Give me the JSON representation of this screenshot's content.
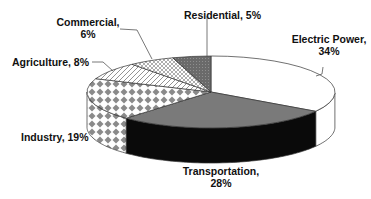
{
  "chart_data": {
    "type": "pie",
    "style": "3d",
    "title": "",
    "start_angle_deg": 90,
    "direction": "clockwise",
    "slices": [
      {
        "label": "Electric Power",
        "value": 34,
        "display": "Electric Power,",
        "pct_text": "34%",
        "fill": "white"
      },
      {
        "label": "Transportation",
        "value": 28,
        "display": "Transportation,",
        "pct_text": "28%",
        "fill": "black-side-gray-top"
      },
      {
        "label": "Industry",
        "value": 19,
        "display": "Industry, 19%",
        "pct_text": "",
        "fill": "diamond-pattern"
      },
      {
        "label": "Agriculture",
        "value": 8,
        "display": "Agriculture, 8%",
        "pct_text": "",
        "fill": "diagonal-hatch"
      },
      {
        "label": "Commercial",
        "value": 6,
        "display": "Commercial,",
        "pct_text": "6%",
        "fill": "crosshatch"
      },
      {
        "label": "Residential",
        "value": 5,
        "display": "Residential, 5%",
        "pct_text": "",
        "fill": "dark-dotted"
      }
    ],
    "legend": "none",
    "units": "%"
  },
  "colors": {
    "outline": "#333333",
    "transport_top": "#7a7a7a",
    "transport_side": "#0a0a0a",
    "diamond": "#8a8a8a",
    "residential": "#6e6e6e"
  }
}
